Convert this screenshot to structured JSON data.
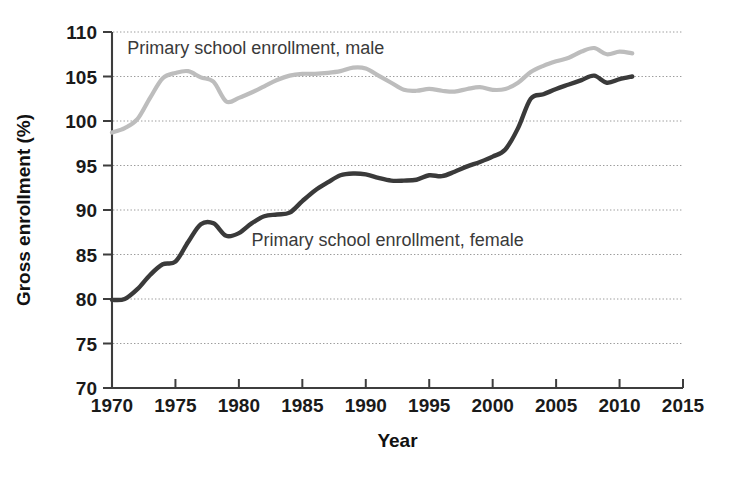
{
  "chart_data": {
    "type": "line",
    "title": "",
    "xlabel": "Year",
    "ylabel": "Gross enrollment (%)",
    "xlim": [
      1970,
      2015
    ],
    "ylim": [
      70,
      110
    ],
    "xticks": [
      1970,
      1975,
      1980,
      1985,
      1990,
      1995,
      2000,
      2005,
      2010,
      2015
    ],
    "yticks": [
      70,
      75,
      80,
      85,
      90,
      95,
      100,
      105,
      110
    ],
    "grid": "horizontal-dotted",
    "legend_position": "inline-annotations",
    "colors": {
      "male": "#bdbdbd",
      "female": "#3a3a3a",
      "axis": "#3d3d3d",
      "grid": "#9a9a9a",
      "text": "#1a1a1a",
      "background": "#ffffff"
    },
    "annotations": [
      {
        "name": "male-series-label",
        "text": "Primary school enrollment, male",
        "x": 1971.2,
        "y": 108.2
      },
      {
        "name": "female-series-label",
        "text": "Primary school enrollment, female",
        "x": 1981.0,
        "y": 86.6
      }
    ],
    "series": [
      {
        "name": "Primary school enrollment, male",
        "color": "#bdbdbd",
        "x": [
          1970,
          1971,
          1972,
          1973,
          1974,
          1975,
          1976,
          1977,
          1978,
          1979,
          1980,
          1981,
          1982,
          1983,
          1984,
          1985,
          1986,
          1987,
          1988,
          1989,
          1990,
          1991,
          1992,
          1993,
          1994,
          1995,
          1996,
          1997,
          1998,
          1999,
          2000,
          2001,
          2002,
          2003,
          2004,
          2005,
          2006,
          2007,
          2008,
          2009,
          2010,
          2011
        ],
        "values": [
          98.7,
          99.2,
          100.2,
          102.6,
          104.8,
          105.4,
          105.6,
          104.9,
          104.4,
          102.2,
          102.6,
          103.2,
          103.9,
          104.6,
          105.1,
          105.3,
          105.3,
          105.4,
          105.6,
          106.0,
          105.9,
          105.1,
          104.3,
          103.5,
          103.4,
          103.6,
          103.4,
          103.3,
          103.6,
          103.8,
          103.5,
          103.6,
          104.3,
          105.5,
          106.2,
          106.7,
          107.1,
          107.8,
          108.2,
          107.5,
          107.8,
          107.6
        ]
      },
      {
        "name": "Primary school enrollment, female",
        "color": "#3a3a3a",
        "x": [
          1970,
          1971,
          1972,
          1973,
          1974,
          1975,
          1976,
          1977,
          1978,
          1979,
          1980,
          1981,
          1982,
          1983,
          1984,
          1985,
          1986,
          1987,
          1988,
          1989,
          1990,
          1991,
          1992,
          1993,
          1994,
          1995,
          1996,
          1997,
          1998,
          1999,
          2000,
          2001,
          2002,
          2003,
          2004,
          2005,
          2006,
          2007,
          2008,
          2009,
          2010,
          2011
        ],
        "values": [
          79.9,
          80.0,
          81.1,
          82.7,
          83.9,
          84.2,
          86.4,
          88.4,
          88.5,
          87.1,
          87.4,
          88.5,
          89.3,
          89.5,
          89.7,
          91.0,
          92.2,
          93.1,
          93.9,
          94.1,
          94.0,
          93.6,
          93.3,
          93.3,
          93.4,
          93.9,
          93.8,
          94.3,
          94.9,
          95.4,
          96.0,
          96.8,
          99.2,
          102.5,
          103.0,
          103.6,
          104.1,
          104.6,
          105.1,
          104.3,
          104.7,
          105.0
        ]
      }
    ]
  }
}
